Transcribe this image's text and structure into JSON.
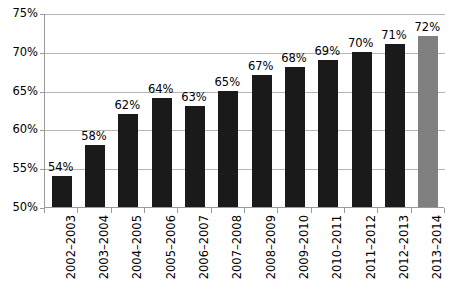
{
  "chart_data": {
    "type": "bar",
    "title": "",
    "subtitle": "",
    "xlabel": "",
    "ylabel": "",
    "categories": [
      "2002–2003",
      "2003–2004",
      "2004–2005",
      "2005–2006",
      "2006–2007",
      "2007–2008",
      "2008–2009",
      "2009–2010",
      "2010–2011",
      "2011–2012",
      "2012–2013",
      "2013–2014"
    ],
    "values": [
      54,
      58,
      62,
      64,
      63,
      65,
      67,
      68,
      69,
      70,
      71,
      72
    ],
    "data_labels": [
      "54%",
      "58%",
      "62%",
      "64%",
      "63%",
      "65%",
      "67%",
      "68%",
      "69%",
      "70%",
      "71%",
      "72%"
    ],
    "bar_colors": [
      "#1a1a1a",
      "#1a1a1a",
      "#1a1a1a",
      "#1a1a1a",
      "#1a1a1a",
      "#1a1a1a",
      "#1a1a1a",
      "#1a1a1a",
      "#1a1a1a",
      "#1a1a1a",
      "#1a1a1a",
      "#808080"
    ],
    "highlighted_category": "2013–2014",
    "ylim": [
      50,
      75
    ],
    "ytick_values": [
      50,
      55,
      60,
      65,
      70,
      75
    ],
    "ytick_labels": [
      "50%",
      "55%",
      "60%",
      "65%",
      "70%",
      "75%"
    ],
    "grid": true,
    "grid_axis": "y",
    "legend": false,
    "legend_position": "none",
    "axis_color": "#9a9a9a",
    "gridline_color": "#b5b5b5",
    "background_color": "#ffffff",
    "text_color": "#000000"
  }
}
